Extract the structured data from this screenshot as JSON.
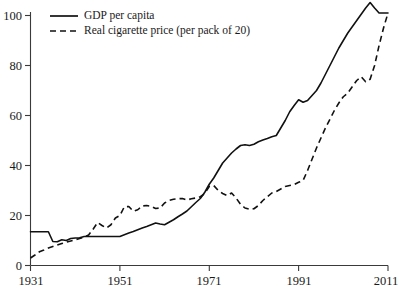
{
  "chart_data": {
    "type": "line",
    "title": "",
    "subtitle": "",
    "xlabel": "",
    "ylabel": "",
    "xlim": [
      1931,
      2011
    ],
    "ylim": [
      0,
      108
    ],
    "grid": false,
    "legend_position": "top-left",
    "x_ticks": [
      "1931",
      "1951",
      "1971",
      "1991",
      "2011"
    ],
    "x_tick_values": [
      1931,
      1951,
      1971,
      1991,
      2011
    ],
    "y_ticks": [
      "0",
      "20",
      "40",
      "60",
      "80",
      "100"
    ],
    "y_tick_values": [
      0,
      20,
      40,
      60,
      80,
      100
    ],
    "series": [
      {
        "name": "GDP per capita",
        "style": "solid",
        "x": [
          1931,
          1932,
          1933,
          1934,
          1935,
          1936,
          1937,
          1938,
          1939,
          1940,
          1941,
          1942,
          1943,
          1944,
          1945,
          1946,
          1947,
          1948,
          1949,
          1950,
          1951,
          1952,
          1953,
          1954,
          1955,
          1956,
          1957,
          1958,
          1959,
          1960,
          1961,
          1962,
          1963,
          1964,
          1965,
          1966,
          1967,
          1968,
          1969,
          1970,
          1971,
          1972,
          1973,
          1974,
          1975,
          1976,
          1977,
          1978,
          1979,
          1980,
          1981,
          1982,
          1983,
          1984,
          1985,
          1986,
          1987,
          1988,
          1989,
          1990,
          1991,
          1992,
          1993,
          1994,
          1995,
          1996,
          1997,
          1998,
          1999,
          2000,
          2001,
          2002,
          2003,
          2004,
          2005,
          2006,
          2007,
          2008,
          2009,
          2010,
          2011
        ],
        "values": [
          13.5,
          13.5,
          13.5,
          13.5,
          13.5,
          9.6,
          9.5,
          10.3,
          10.0,
          10.8,
          11.0,
          11.1,
          11.6,
          11.6,
          11.6,
          11.6,
          11.6,
          11.6,
          11.6,
          11.6,
          11.6,
          12.3,
          13.0,
          13.6,
          14.3,
          15.0,
          15.6,
          16.3,
          17.0,
          16.6,
          16.3,
          17.3,
          18.3,
          19.5,
          20.6,
          21.8,
          23.5,
          25.2,
          26.8,
          29.3,
          32.5,
          35.0,
          38.0,
          41.0,
          43.0,
          45.0,
          46.6,
          48.0,
          48.3,
          48.0,
          48.5,
          49.5,
          50.2,
          50.8,
          51.5,
          52.0,
          55.0,
          58.0,
          61.5,
          64.0,
          66.3,
          65.3,
          66.0,
          68.0,
          70.0,
          73.0,
          76.5,
          80.0,
          83.5,
          87.0,
          90.0,
          93.0,
          95.5,
          98.0,
          100.5,
          103.0,
          105.2,
          103.0,
          101.0,
          101.0,
          101.0
        ]
      },
      {
        "name": "Real cigarette price (per pack of 20)",
        "style": "dashed",
        "x": [
          1931,
          1932,
          1933,
          1934,
          1935,
          1936,
          1937,
          1938,
          1939,
          1940,
          1941,
          1942,
          1943,
          1944,
          1945,
          1946,
          1947,
          1948,
          1949,
          1950,
          1951,
          1952,
          1953,
          1954,
          1955,
          1956,
          1957,
          1958,
          1959,
          1960,
          1961,
          1962,
          1963,
          1964,
          1965,
          1966,
          1967,
          1968,
          1969,
          1970,
          1971,
          1972,
          1973,
          1974,
          1975,
          1976,
          1977,
          1978,
          1979,
          1980,
          1981,
          1982,
          1983,
          1984,
          1985,
          1986,
          1987,
          1988,
          1989,
          1990,
          1991,
          1992,
          1993,
          1994,
          1995,
          1996,
          1997,
          1998,
          1999,
          2000,
          2001,
          2002,
          2003,
          2004,
          2005,
          2006,
          2007,
          2008,
          2009,
          2010,
          2011
        ],
        "values": [
          3.0,
          4.2,
          5.5,
          6.2,
          7.0,
          7.6,
          8.2,
          8.8,
          9.3,
          9.8,
          10.3,
          10.8,
          11.3,
          12.2,
          14.5,
          17.2,
          16.0,
          15.0,
          16.3,
          19.0,
          20.0,
          23.5,
          23.6,
          21.7,
          22.3,
          23.8,
          24.0,
          23.7,
          22.8,
          23.0,
          25.0,
          26.0,
          26.5,
          26.7,
          26.8,
          26.2,
          26.7,
          27.0,
          27.5,
          28.8,
          31.6,
          32.0,
          30.0,
          28.8,
          28.0,
          29.0,
          27.0,
          24.5,
          23.0,
          22.5,
          22.7,
          24.0,
          26.0,
          27.5,
          29.0,
          29.6,
          30.6,
          31.6,
          32.0,
          32.4,
          33.3,
          34.0,
          38.0,
          42.5,
          47.0,
          51.0,
          55.0,
          58.5,
          62.0,
          65.0,
          67.5,
          69.0,
          71.5,
          74.0,
          75.5,
          73.5,
          74.5,
          80.0,
          88.0,
          95.0,
          101.0
        ]
      }
    ]
  },
  "legend": {
    "items": [
      {
        "label": "GDP per capita",
        "style": "solid"
      },
      {
        "label": "Real cigarette price (per pack of 20)",
        "style": "dashed"
      }
    ]
  },
  "axis": {
    "y_labels": [
      "100",
      "80",
      "60",
      "40",
      "20",
      "0"
    ],
    "x_labels": [
      "1931",
      "1951",
      "1971",
      "1991",
      "2011"
    ]
  }
}
